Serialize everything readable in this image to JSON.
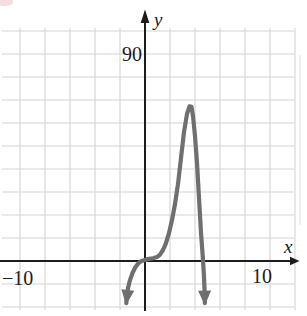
{
  "page": {
    "background": "#ffffff"
  },
  "artifacts": {
    "top_left_smudge_color": "#eec3c7",
    "right_edge_streak_color": "#d9d9d9"
  },
  "chart_data": {
    "type": "line",
    "title": "",
    "xlabel": "x",
    "ylabel": "y",
    "x_tick_labels": [
      "−10",
      "10"
    ],
    "y_tick_labels": [
      "90"
    ],
    "x_ticks": [
      -10,
      10
    ],
    "y_ticks": [
      90
    ],
    "xlim": [
      -11.6,
      13.0
    ],
    "ylim": [
      -24,
      113.5
    ],
    "grid": {
      "show": true,
      "color": "#d7d3d0",
      "x_step": 2,
      "y_step": 10,
      "x_min": -10,
      "x_max": 12,
      "y_min": -20,
      "y_max": 100
    },
    "axis_color": "#1c1c1c",
    "curve": {
      "color": "#6f6f6f",
      "width": 4.2,
      "points": [
        [
          -1.5,
          -18.3
        ],
        [
          -1.46,
          -15.2
        ],
        [
          -1.36,
          -11.7
        ],
        [
          -1.2,
          -8.3
        ],
        [
          -1.0,
          -5.2
        ],
        [
          -0.76,
          -2.6
        ],
        [
          -0.52,
          -0.9
        ],
        [
          -0.28,
          0.0
        ],
        [
          0.0,
          0.5
        ],
        [
          0.32,
          0.9
        ],
        [
          0.64,
          1.2
        ],
        [
          0.96,
          1.7
        ],
        [
          1.2,
          2.8
        ],
        [
          1.44,
          4.8
        ],
        [
          1.68,
          7.8
        ],
        [
          1.92,
          12.2
        ],
        [
          2.16,
          17.8
        ],
        [
          2.4,
          24.8
        ],
        [
          2.64,
          33.5
        ],
        [
          2.88,
          44.8
        ],
        [
          3.12,
          56.1
        ],
        [
          3.36,
          63.9
        ],
        [
          3.56,
          67.2
        ],
        [
          3.72,
          67.0
        ],
        [
          3.84,
          63.0
        ],
        [
          4.0,
          54.3
        ],
        [
          4.16,
          42.6
        ],
        [
          4.32,
          27.4
        ],
        [
          4.48,
          12.2
        ],
        [
          4.62,
          1.7
        ],
        [
          4.7,
          -5.2
        ],
        [
          4.76,
          -12.2
        ],
        [
          4.79,
          -18.3
        ]
      ],
      "arrow_left": [
        -1.52,
        -19.1
      ],
      "arrow_right": [
        4.79,
        -19.4
      ],
      "features": {
        "local_max": [
          3.6,
          67
        ],
        "x_intercepts": [
          -0.3,
          4.6
        ],
        "flat_tangent_near_origin": true
      }
    }
  }
}
